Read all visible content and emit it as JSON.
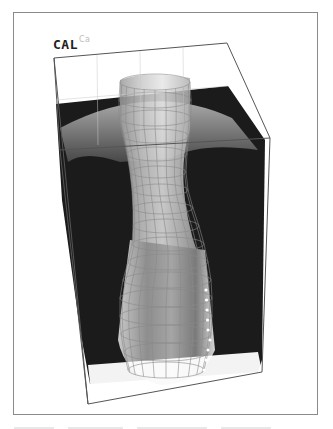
{
  "figure": {
    "label_main": "CAL",
    "label_sup": "Ca",
    "colors": {
      "backdrop": "#1a1a1a",
      "box_edge": "#555555",
      "mesh": "#888888",
      "frame": "#8a8a8a"
    }
  }
}
